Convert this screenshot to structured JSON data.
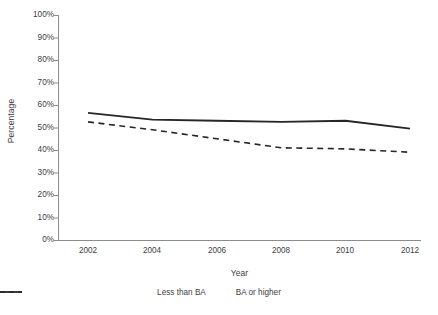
{
  "chart_data": {
    "type": "line",
    "title": "",
    "xlabel": "Year",
    "ylabel": "Percentage",
    "x": [
      2002,
      2004,
      2006,
      2008,
      2010,
      2012
    ],
    "xtick_labels": [
      "2002",
      "2004",
      "2006",
      "2008",
      "2010",
      "2012"
    ],
    "xlim": [
      2002,
      2012
    ],
    "ylim": [
      0,
      100
    ],
    "ytick_labels": [
      "100%",
      "90%",
      "80%",
      "70%",
      "60%",
      "50%",
      "40%",
      "30%",
      "20%",
      "10%",
      "0%"
    ],
    "ytick_values": [
      100,
      90,
      80,
      70,
      60,
      50,
      40,
      30,
      20,
      10,
      0
    ],
    "grid": false,
    "legend_position": "bottom",
    "series": [
      {
        "name": "Less than BA",
        "style": "dashed",
        "color": "#262626",
        "values": [
          52.5,
          49.0,
          45.0,
          41.0,
          40.5,
          39.0
        ]
      },
      {
        "name": "BA or higher",
        "style": "solid",
        "color": "#262626",
        "values": [
          56.5,
          53.5,
          53.0,
          52.5,
          53.0,
          49.5
        ]
      }
    ]
  },
  "axes": {
    "x_title": "Year",
    "y_title": "Percentage"
  },
  "legend": {
    "items": [
      {
        "label": "Less than BA",
        "style": "dashed"
      },
      {
        "label": "BA or higher",
        "style": "solid"
      }
    ]
  },
  "colors": {
    "line": "#262626",
    "axis": "#808080",
    "text": "#404040",
    "background": "#ffffff"
  }
}
